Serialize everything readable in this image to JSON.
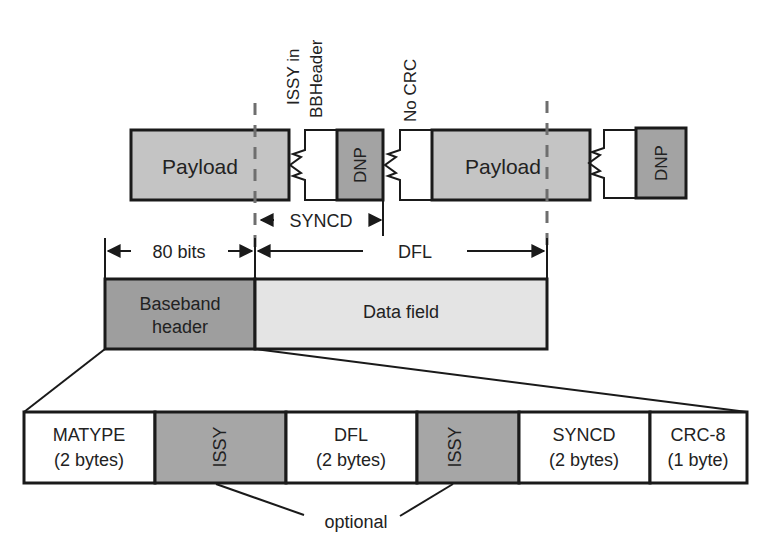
{
  "colors": {
    "payload_fill": "#c4c4c4",
    "dnp_fill": "#a3a3a3",
    "header_fill": "#9e9e9e",
    "datafield_fill": "#e4e4e4",
    "issy_fill": "#a6a6a6",
    "plain_fill": "#ffffff",
    "stroke": "#1a1a1a",
    "dashed_line": "#6e6e6e"
  },
  "top_row": {
    "payload_1": "Payload",
    "dnp_1": "DNP",
    "payload_2": "Payload",
    "dnp_2": "DNP",
    "note_issy_line1": "ISSY in",
    "note_issy_line2": "BBHeader",
    "note_crc": "No CRC"
  },
  "dimensions": {
    "syncd": "SYNCD",
    "header_bits": "80 bits",
    "dfl": "DFL"
  },
  "bbframe": {
    "header_line1": "Baseband",
    "header_line2": "header",
    "data_field": "Data field"
  },
  "header_fields": [
    {
      "line1": "MATYPE",
      "line2": "(2 bytes)",
      "optional": false
    },
    {
      "line1": "ISSY",
      "line2": "",
      "optional": true
    },
    {
      "line1": "DFL",
      "line2": "(2 bytes)",
      "optional": false
    },
    {
      "line1": "ISSY",
      "line2": "",
      "optional": true
    },
    {
      "line1": "SYNCD",
      "line2": "(2 bytes)",
      "optional": false
    },
    {
      "line1": "CRC-8",
      "line2": "(1 byte)",
      "optional": false
    }
  ],
  "optional_label": "optional"
}
